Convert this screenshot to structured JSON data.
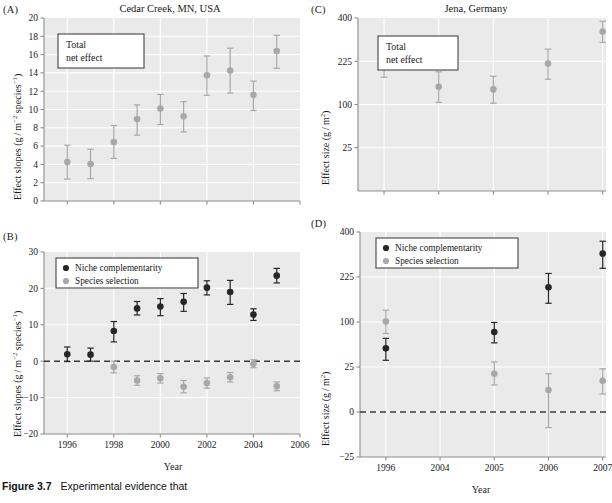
{
  "figure": {
    "caption_label": "Figure 3.7",
    "caption_text": "Experimental evidence that"
  },
  "style": {
    "plot_bg": "#eaeaea",
    "grid_color": "#ffffff",
    "axis_color": "#8d8d8d",
    "dark_marker": "#262626",
    "light_marker": "#a8a8a8",
    "zero_line": "#3a3a3a"
  },
  "legend_labels": {
    "niche": "Niche complementarity",
    "selection": "Species selection"
  },
  "box_label": {
    "line1": "Total",
    "line2": "net effect"
  },
  "chart_data": [
    {
      "id": "A",
      "panel_tag": "(A)",
      "type": "scatter",
      "title": "Cedar Creek, MN, USA",
      "xlabel": "",
      "ylabel": "Effect slopes (g / m−2 species−1)",
      "ylabel_parts": [
        "Effect slopes (g / m",
        "−2",
        " species",
        "−1",
        ")"
      ],
      "yscale": "linear",
      "ylim": [
        0,
        20
      ],
      "yticks": [
        0,
        2,
        4,
        6,
        8,
        10,
        12,
        14,
        16,
        18,
        20
      ],
      "ytick_labels": [
        "0",
        "2",
        "4",
        "6",
        "8",
        "10",
        "12",
        "14",
        "16",
        "18",
        "20"
      ],
      "xlim": [
        1995,
        2006
      ],
      "xticks": [
        1996,
        1998,
        2000,
        2002,
        2004,
        2006
      ],
      "xtick_labels": [
        "",
        "",
        "",
        "",
        "",
        ""
      ],
      "grid": true,
      "annotation_box": "Total net effect",
      "series": [
        {
          "name": "Total net effect",
          "color": "light",
          "x": [
            1996,
            1997,
            1998,
            1999,
            2000,
            2001,
            2002,
            2003,
            2004,
            2005
          ],
          "values": [
            4.25,
            4.05,
            6.45,
            8.95,
            10.1,
            9.25,
            13.75,
            14.25,
            11.6,
            16.4
          ],
          "err_low": [
            1.85,
            1.6,
            1.8,
            1.75,
            1.75,
            1.7,
            2.2,
            2.45,
            1.7,
            1.9
          ],
          "err_high": [
            1.85,
            1.6,
            1.8,
            1.55,
            1.55,
            1.6,
            2.1,
            2.45,
            1.5,
            1.7
          ]
        }
      ]
    },
    {
      "id": "B",
      "panel_tag": "(B)",
      "type": "scatter",
      "title": "",
      "xlabel": "Year",
      "ylabel": "Effect slopes (g / m−2 species−1)",
      "ylabel_parts": [
        "Effect slopes (g / m",
        "−2",
        " species",
        "−1",
        ")"
      ],
      "yscale": "linear",
      "ylim": [
        -20,
        30
      ],
      "yticks": [
        -20,
        -10,
        0,
        10,
        20,
        30
      ],
      "ytick_labels": [
        "−20",
        "−10",
        "0",
        "10",
        "20",
        "30"
      ],
      "xlim": [
        1995,
        2006
      ],
      "xticks": [
        1996,
        1998,
        2000,
        2002,
        2004,
        2006
      ],
      "xtick_labels": [
        "1996",
        "1998",
        "2000",
        "2002",
        "2004",
        "2006"
      ],
      "grid": true,
      "zero_line": 0,
      "legend": [
        "Niche complementarity",
        "Species selection"
      ],
      "series": [
        {
          "name": "Niche complementarity",
          "color": "dark",
          "x": [
            1996,
            1997,
            1998,
            1999,
            2000,
            2001,
            2002,
            2003,
            2004,
            2005
          ],
          "values": [
            1.9,
            1.8,
            8.3,
            14.5,
            15.0,
            16.3,
            20.2,
            19.0,
            12.8,
            23.5
          ],
          "err_low": [
            2.0,
            1.8,
            3.0,
            1.8,
            2.5,
            2.6,
            2.0,
            3.4,
            1.6,
            2.0
          ],
          "err_high": [
            2.0,
            1.8,
            2.6,
            1.9,
            2.2,
            2.3,
            1.9,
            3.2,
            1.6,
            2.0
          ]
        },
        {
          "name": "Species selection",
          "color": "light",
          "x": [
            1998,
            1999,
            2000,
            2001,
            2002,
            2003,
            2004,
            2005
          ],
          "values": [
            -1.6,
            -5.3,
            -4.7,
            -7.0,
            -6.0,
            -4.4,
            -0.7,
            -6.9
          ],
          "err_low": [
            1.6,
            1.3,
            1.3,
            1.7,
            1.4,
            1.3,
            1.1,
            1.2
          ],
          "err_high": [
            1.6,
            1.3,
            1.3,
            1.7,
            1.4,
            1.3,
            1.1,
            1.2
          ]
        }
      ]
    },
    {
      "id": "C",
      "panel_tag": "(C)",
      "type": "scatter",
      "title": "Jena, Germany",
      "xlabel": "",
      "ylabel": "Effect size (g / m2)",
      "ylabel_parts": [
        "Effect size (g / m",
        "2",
        ")"
      ],
      "yscale": "sqrt",
      "ylim": [
        0,
        400
      ],
      "yticks": [
        25,
        100,
        225,
        400
      ],
      "ytick_labels": [
        "25",
        "100",
        "225",
        "400"
      ],
      "xlim": [
        1995.2,
        2007.6
      ],
      "xticks": [
        1996,
        2004,
        2005,
        2006,
        2007
      ],
      "xtick_labels": [
        "",
        "",
        "",
        "",
        ""
      ],
      "grid": true,
      "annotation_box": "Total net effect",
      "series": [
        {
          "name": "Total net effect",
          "color": "light",
          "x": [
            1996,
            2004,
            2005,
            2006,
            2007
          ],
          "values": [
            215,
            145,
            138,
            217,
            340
          ],
          "err_low": [
            42,
            40,
            35,
            50,
            45
          ],
          "err_high": [
            45,
            45,
            38,
            52,
            45
          ]
        }
      ]
    },
    {
      "id": "D",
      "panel_tag": "(D)",
      "type": "scatter",
      "title": "",
      "xlabel": "Year",
      "ylabel": "Effect size (g / m2)",
      "ylabel_parts": [
        "Effect size (g / m",
        "2",
        ")"
      ],
      "yscale": "sqrt-signed",
      "ylim": [
        -25,
        400
      ],
      "yticks": [
        -25,
        0,
        25,
        100,
        225,
        400
      ],
      "ytick_labels": [
        "−25",
        "0",
        "25",
        "100",
        "225",
        "400"
      ],
      "xlim": [
        1995.2,
        2007.6
      ],
      "xticks": [
        1996,
        2004,
        2005,
        2006,
        2007
      ],
      "xtick_labels": [
        "1996",
        "2004",
        "2005",
        "2006",
        "2007"
      ],
      "grid": true,
      "zero_line": 0,
      "legend": [
        "Niche complementarity",
        "Species selection"
      ],
      "series": [
        {
          "name": "Niche complementarity",
          "color": "dark",
          "x": [
            1996,
            2005,
            2006,
            2007
          ],
          "values": [
            50,
            79,
            192,
            310
          ],
          "err_low": [
            17,
            20,
            46,
            55
          ],
          "err_high": [
            17,
            20,
            45,
            50
          ]
        },
        {
          "name": "Species selection",
          "color": "light",
          "x": [
            1996,
            2005,
            2006,
            2007
          ],
          "values": [
            101,
            18,
            6,
            12
          ],
          "err_low": [
            25,
            9,
            9,
            8
          ],
          "err_high": [
            27,
            13,
            12,
            11
          ]
        }
      ]
    }
  ]
}
